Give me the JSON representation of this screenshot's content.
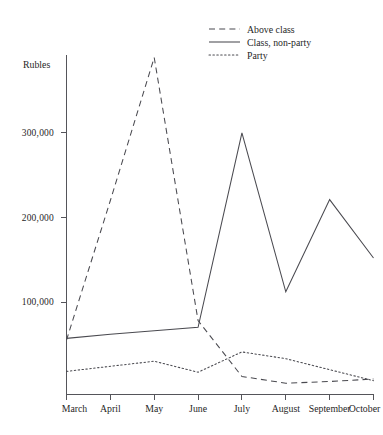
{
  "chart_data": {
    "type": "line",
    "title": "",
    "xlabel": "",
    "ylabel": "Rubles",
    "categories": [
      "March",
      "April",
      "May",
      "June",
      "July",
      "August",
      "September",
      "October"
    ],
    "ytick_labels": [
      "100,000",
      "200,000",
      "300,000"
    ],
    "ytick_values": [
      100000,
      200000,
      300000
    ],
    "ylim": [
      0,
      400000
    ],
    "grid": false,
    "legend_position": "top-right",
    "series": [
      {
        "name": "Above class",
        "style": "dashed",
        "values": [
          55000,
          220000,
          389000,
          78000,
          12000,
          4000,
          6000,
          9000
        ]
      },
      {
        "name": "Class, non-party",
        "style": "solid",
        "values": [
          57000,
          62000,
          66000,
          70000,
          300000,
          112000,
          221000,
          152000
        ]
      },
      {
        "name": "Party",
        "style": "dotted",
        "values": [
          18000,
          24000,
          30000,
          17000,
          41000,
          33000,
          20000,
          7000
        ]
      }
    ]
  },
  "legend": {
    "items": [
      {
        "label": "Above class",
        "style": "dashed"
      },
      {
        "label": "Class, non-party",
        "style": "solid"
      },
      {
        "label": "Party",
        "style": "dotted"
      }
    ]
  }
}
